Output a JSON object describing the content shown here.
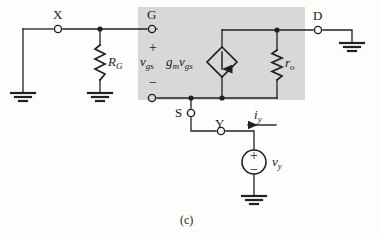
{
  "figure": {
    "caption": "(c)",
    "type": "small-signal MOSFET equivalent circuit",
    "shaded_region_color": "#d8d8d6",
    "line_color": "#231f20",
    "background_color": "#fdfdfc"
  },
  "terminals": [
    {
      "id": "X",
      "label": "X",
      "x": 58,
      "y": 29,
      "style": "open-circle"
    },
    {
      "id": "G",
      "label": "G",
      "x": 152,
      "y": 30,
      "style": "open-circle"
    },
    {
      "id": "D",
      "label": "D",
      "x": 318,
      "y": 30,
      "style": "open-circle"
    },
    {
      "id": "S",
      "label": "S",
      "x": 191,
      "y": 113,
      "style": "open-circle"
    },
    {
      "id": "Y",
      "label": "Y",
      "x": 221,
      "y": 131,
      "style": "open-circle"
    },
    {
      "id": "Sbox",
      "label": "",
      "x": 152,
      "y": 98,
      "style": "open-circle"
    }
  ],
  "components": [
    {
      "id": "RG",
      "kind": "resistor",
      "label_base": "R",
      "label_sub": "G",
      "orientation": "vertical",
      "x": 100,
      "y_top": 45,
      "y_bottom": 80
    },
    {
      "id": "ro",
      "kind": "resistor",
      "label_base": "r",
      "label_sub": "o",
      "orientation": "vertical",
      "x": 277,
      "y_top": 50,
      "y_bottom": 80
    },
    {
      "id": "gmvgs",
      "kind": "dependent-current-source",
      "shape": "diamond",
      "label_base": "g",
      "label_sub1": "m",
      "label_base2": "v",
      "label_sub2": "gs",
      "arrow_direction": "down",
      "cx": 222,
      "cy": 62
    },
    {
      "id": "vy",
      "kind": "independent-voltage-source",
      "shape": "circle",
      "label_base": "v",
      "label_sub": "y",
      "plus": "+",
      "minus": "−",
      "cx": 254,
      "cy": 162
    }
  ],
  "port_labels": {
    "vgs_base": "v",
    "vgs_sub": "gs",
    "plus": "+",
    "minus": "−"
  },
  "current_labels": [
    {
      "id": "iy",
      "label_base": "i",
      "label_sub": "y",
      "arrow_direction": "left",
      "x": 262,
      "y": 117
    }
  ],
  "grounds": [
    {
      "id": "ground-left",
      "x": 23,
      "y": 93
    },
    {
      "id": "ground-RG",
      "x": 100,
      "y": 93
    },
    {
      "id": "ground-D",
      "x": 352,
      "y": 43
    },
    {
      "id": "ground-vy",
      "x": 254,
      "y": 196
    }
  ],
  "shaded_box": {
    "x": 138,
    "y": 7,
    "width": 167,
    "height": 93
  }
}
